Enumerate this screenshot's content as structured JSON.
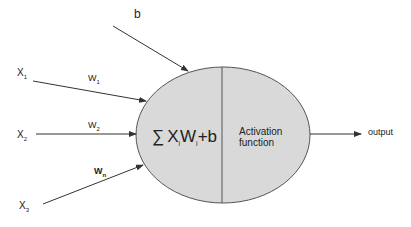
{
  "diagram": {
    "bias_label": "b",
    "inputs": [
      {
        "label": "X",
        "subscript": "1",
        "weight": "W",
        "weight_subscript": "1"
      },
      {
        "label": "X",
        "subscript": "2",
        "weight": "W",
        "weight_subscript": "2"
      },
      {
        "label": "X",
        "subscript": "3",
        "weight": "W",
        "weight_subscript": "n"
      }
    ],
    "summation": {
      "symbol": "∑",
      "x": "X",
      "x_sub": "i",
      "w": "W",
      "w_sub": "i",
      "bias": "+b"
    },
    "activation_label_line1": "Activation",
    "activation_label_line2": "function",
    "output_label": "output",
    "colors": {
      "neuron_fill": "#d9d9d9",
      "stroke": "#555555",
      "text": "#222222"
    }
  }
}
